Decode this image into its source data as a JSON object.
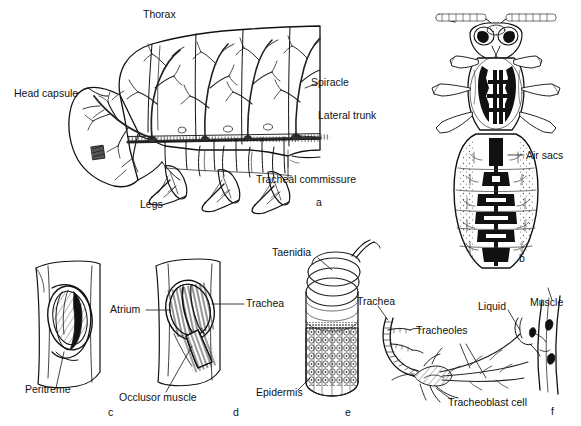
{
  "figure": {
    "background_color": "#ffffff",
    "ink_color": "#111111",
    "panels": [
      {
        "letter": "a",
        "name": "lateral-tracheal-system",
        "labels": [
          {
            "key": "thorax",
            "text": "Thorax"
          },
          {
            "key": "head",
            "text": "Head capsule"
          },
          {
            "key": "spiracle",
            "text": "Spiracle"
          },
          {
            "key": "lateral",
            "text": "Lateral trunk"
          },
          {
            "key": "commiss",
            "text": "Tracheal commissure"
          },
          {
            "key": "legs",
            "text": "Legs"
          }
        ]
      },
      {
        "letter": "b",
        "name": "dorsal-air-sacs",
        "labels": [
          {
            "key": "airsacs",
            "text": "Air sacs"
          }
        ]
      },
      {
        "letter": "c",
        "name": "spiracle-open",
        "labels": [
          {
            "key": "peritreme",
            "text": "Peritreme"
          }
        ]
      },
      {
        "letter": "d",
        "name": "spiracle-with-occlusor",
        "labels": [
          {
            "key": "atrium",
            "text": "Atrium"
          },
          {
            "key": "trachea",
            "text": "Trachea"
          },
          {
            "key": "occlusor",
            "text": "Occlusor muscle"
          }
        ]
      },
      {
        "letter": "e",
        "name": "trachea-taenidia",
        "labels": [
          {
            "key": "taenidia",
            "text": "Taenidia"
          },
          {
            "key": "epidermis",
            "text": "Epidermis"
          }
        ]
      },
      {
        "letter": "f",
        "name": "tracheoles-on-muscle",
        "labels": [
          {
            "key": "trachea",
            "text": "Trachea"
          },
          {
            "key": "tracheoles",
            "text": "Tracheoles"
          },
          {
            "key": "liquid",
            "text": "Liquid"
          },
          {
            "key": "muscle",
            "text": "Muscle"
          },
          {
            "key": "tracheoblast",
            "text": "Tracheoblast cell"
          }
        ]
      }
    ],
    "panel_letters": {
      "a": "a",
      "b": "b",
      "c": "c",
      "d": "d",
      "e": "e",
      "f": "f"
    }
  }
}
